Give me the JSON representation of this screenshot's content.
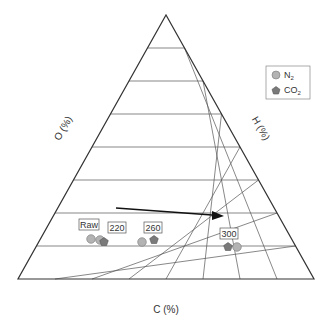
{
  "chart_data": {
    "type": "ternary-scatter",
    "title": "",
    "axes": {
      "bottom": {
        "label": "C (%)",
        "ticks": [
          "40",
          "45",
          "50",
          "55",
          "60",
          "65",
          "70",
          "75",
          "80"
        ]
      },
      "right": {
        "label": "H (%)",
        "ticks": [
          "0",
          "5",
          "10",
          "15",
          "20",
          "25",
          "30",
          "35",
          "40"
        ]
      },
      "left": {
        "label": "O (%)",
        "ticks": [
          "20",
          "25",
          "30",
          "35",
          "40",
          "45",
          "50",
          "55",
          "60"
        ]
      }
    },
    "legend": [
      {
        "name": "N₂",
        "marker": "circle",
        "color": "#b3b3b3"
      },
      {
        "name": "CO₂",
        "marker": "pentagon",
        "color": "#7a7a7a"
      }
    ],
    "annotations": [
      "Raw",
      "220",
      "260",
      "300"
    ],
    "arrow": {
      "from": [
        48,
        11
      ],
      "to": [
        66,
        9
      ],
      "note": "direction of increasing temperature (C%, H%)"
    },
    "series": [
      {
        "name": "N2",
        "points": [
          {
            "label": "Raw",
            "C": 47,
            "H": 5.9,
            "O": 47
          },
          {
            "label": "220",
            "C": 48.5,
            "H": 5.8,
            "O": 45.7
          },
          {
            "label": "260",
            "C": 55.8,
            "H": 5.5,
            "O": 38.7
          },
          {
            "label": "300",
            "C": 71,
            "H": 4.8,
            "O": 24.2
          }
        ]
      },
      {
        "name": "CO2",
        "points": [
          {
            "label": "220",
            "C": 49,
            "H": 5.5,
            "O": 45.5
          },
          {
            "label": "260",
            "C": 57.5,
            "H": 5.9,
            "O": 36.6
          },
          {
            "label": "300",
            "C": 69.8,
            "H": 4.8,
            "O": 25.4
          }
        ]
      }
    ]
  },
  "labels": {
    "c_axis": "C (%)",
    "h_axis": "H (%)",
    "o_axis": "O (%)",
    "legend_n2": "N",
    "legend_co2": "CO",
    "sub2": "2",
    "raw": "Raw",
    "t220": "220",
    "t260": "260",
    "t300": "300"
  }
}
